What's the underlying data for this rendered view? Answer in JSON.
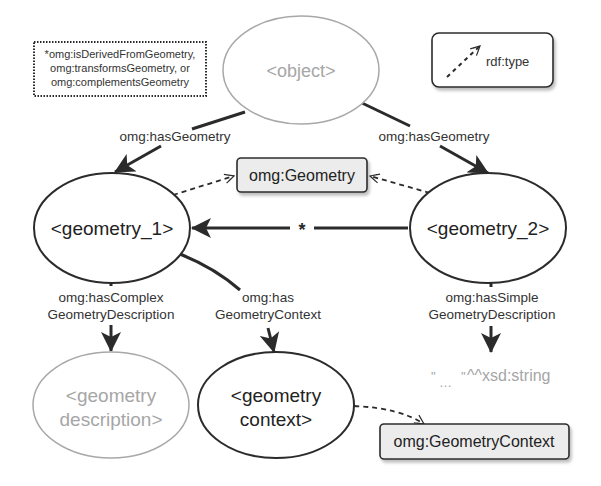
{
  "colors": {
    "stroke_dark": "#2b2b2b",
    "stroke_gray": "#a8a8a8",
    "text_dark": "#222222",
    "text_gray": "#a6a6a6",
    "class_box_fill": "#ececec",
    "background": "#ffffff"
  },
  "note": {
    "lines": [
      "*omg:isDerivedFromGeometry,",
      "omg:transformsGeometry, or",
      "omg:complementsGeometry"
    ]
  },
  "legend": {
    "label": "rdf:type",
    "icon": "dashed-arrow-icon"
  },
  "nodes": {
    "object": {
      "label": "<object>",
      "style": "placeholder"
    },
    "geometry_1": {
      "label": "<geometry_1>",
      "style": "instance"
    },
    "geometry_2": {
      "label": "<geometry_2>",
      "style": "instance"
    },
    "geometry_description": {
      "lines": [
        "<geometry",
        "description>"
      ],
      "style": "placeholder"
    },
    "geometry_context": {
      "lines": [
        "<geometry",
        "context>"
      ],
      "style": "instance"
    },
    "literal": {
      "quote_open": "\"",
      "ellipsis": "…",
      "quote_close": "\"",
      "datatype": "^^xsd:string",
      "style": "placeholder"
    }
  },
  "classes": {
    "geometry": {
      "label": "omg:Geometry"
    },
    "geometry_context": {
      "label": "omg:GeometryContext"
    }
  },
  "edges": {
    "object_to_geometry_1": {
      "label": "omg:hasGeometry"
    },
    "object_to_geometry_2": {
      "label": "omg:hasGeometry"
    },
    "geometry_2_to_geometry_1": {
      "label": "*"
    },
    "geometry_1_complex": {
      "lines": [
        "omg:hasComplex",
        "GeometryDescription"
      ]
    },
    "geometry_1_context": {
      "lines": [
        "omg:has",
        "GeometryContext"
      ]
    },
    "geometry_2_simple": {
      "lines": [
        "omg:hasSimple",
        "GeometryDescription"
      ]
    }
  }
}
